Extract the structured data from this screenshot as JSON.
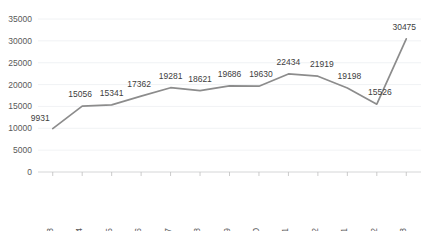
{
  "chart_data": {
    "type": "line",
    "title": "",
    "subtitle": "",
    "xlabel": "",
    "ylabel": "",
    "categories": [
      "2020.03",
      "2020.04",
      "2020.05",
      "2020.06",
      "2020.07",
      "2020.08",
      "2020.09",
      "2020.10",
      "2020.11",
      "2020.12",
      "2021.01",
      "2021.02",
      "2021.03"
    ],
    "values": [
      9931,
      15056,
      15341,
      17362,
      19281,
      18621,
      19686,
      19630,
      22434,
      21919,
      19198,
      15526,
      30475
    ],
    "data_labels": [
      "9931",
      "15056",
      "15341",
      "17362",
      "19281",
      "18621",
      "19686",
      "19630",
      "22434",
      "21919",
      "19198",
      "15526",
      "30475"
    ],
    "ylim": [
      0,
      35000
    ],
    "ytick_values": [
      0,
      5000,
      10000,
      15000,
      20000,
      25000,
      30000,
      35000
    ],
    "ytick_labels": [
      "0",
      "5000",
      "10000",
      "15000",
      "20000",
      "25000",
      "30000",
      "35000"
    ],
    "grid": true,
    "legend": false,
    "legend_position": "none",
    "series": [
      {
        "name": "",
        "color": "#8c8c8c",
        "values": [
          9931,
          15056,
          15341,
          17362,
          19281,
          18621,
          19686,
          19630,
          22434,
          21919,
          19198,
          15526,
          30475
        ]
      }
    ]
  },
  "style": {
    "line_color": "#8c8c8c",
    "grid_color": "#eceff1",
    "axis_color": "#d9d9d9",
    "tick_color": "#bfbfbf",
    "label_color": "#595959",
    "data_label_color": "#404040",
    "background": "#ffffff"
  }
}
